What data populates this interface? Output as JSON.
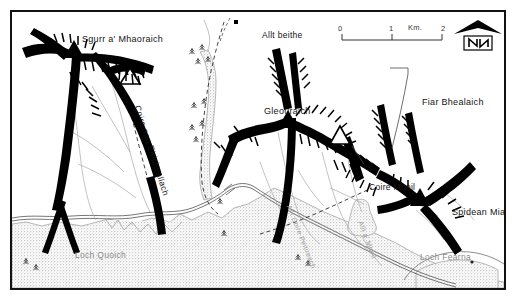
{
  "map": {
    "title": "Sgurr a' Mhaoraich / Gleouraich / Spidean Mialach hillwalking map",
    "region": "Glen Quoich, Scotland",
    "border_color": "#111111",
    "background_color": "#ffffff",
    "ink_color": "#000000",
    "water_fill": "#cfcfcf",
    "label_color": "#141414",
    "water_label_color": "#8a8a8a",
    "stream_label_color": "#9a9a9a"
  },
  "peaks": [
    {
      "id": "sgurr-a-mhaoraich",
      "label": "Sgurr a' Mhaoraich",
      "marker": "filled-triangle",
      "x": 70,
      "y": 22
    },
    {
      "id": "gleouraich",
      "label": "Gleouraich",
      "marker": "filled-triangle",
      "x": 252,
      "y": 94
    },
    {
      "id": "fiar-bhealaich",
      "label": "Fiar Bhealaich",
      "marker": "open-triangle",
      "x": 410,
      "y": 85
    },
    {
      "id": "spidean-mialach",
      "label": "Spidean Mialach",
      "marker": "filled-triangle",
      "x": 440,
      "y": 195
    }
  ],
  "features": [
    {
      "id": "allt-beithe",
      "label": "Allt beithe",
      "marker": "black-square",
      "x": 250,
      "y": 18
    },
    {
      "id": "coire-nan-eiricheallach",
      "label": "Coire nan Eiricheallach",
      "x": 130,
      "y": 92
    },
    {
      "id": "coire-mheil",
      "label": "Coire Mheil",
      "x": 357,
      "y": 170
    }
  ],
  "water": [
    {
      "id": "loch-quoich",
      "label": "Loch Quoich",
      "x": 63,
      "y": 238
    },
    {
      "id": "loch-fearna",
      "label": "Loch Fearna",
      "x": 408,
      "y": 240
    }
  ],
  "streams": [
    {
      "id": "allt-coire-peitireach",
      "label": "Allt Coire Peitireach",
      "x": 280,
      "y": 192
    },
    {
      "id": "allt-a-mheil",
      "label": "Allt a' Mheil",
      "x": 352,
      "y": 208
    }
  ],
  "scale_bar": {
    "id": "scale-bar",
    "unit": "Km.",
    "ticks": [
      "0",
      "1",
      "2"
    ],
    "length_px": 100,
    "x": 340,
    "y": 30
  },
  "north_arrow": {
    "id": "north-arrow",
    "letter": "N",
    "x": 470,
    "y": 30
  },
  "legend_symbols": [
    {
      "name": "filled-triangle",
      "meaning": "summit (munro)"
    },
    {
      "name": "open-triangle",
      "meaning": "subsidiary top"
    },
    {
      "name": "black-square",
      "meaning": "building / bothy"
    },
    {
      "name": "conifer-tree",
      "meaning": "woodland"
    },
    {
      "name": "hachure",
      "meaning": "crag / steep slope"
    },
    {
      "name": "dashed-line",
      "meaning": "path"
    },
    {
      "name": "double-line",
      "meaning": "road"
    }
  ]
}
